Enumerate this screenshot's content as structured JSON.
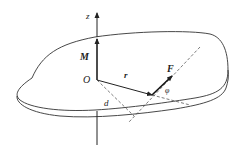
{
  "figure": {
    "type": "moment of a force about an axis",
    "labels": {
      "axis": "z",
      "moment": "M",
      "origin": "O",
      "position_vector": "r",
      "force": "F",
      "lever_arm": "d",
      "angle": "φ"
    },
    "colors": {
      "stroke": "#333333",
      "background": "#ffffff"
    }
  }
}
